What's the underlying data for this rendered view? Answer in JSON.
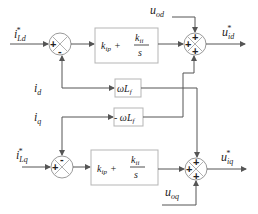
{
  "diagram": {
    "inputs": {
      "i_ref_d": {
        "main": "i",
        "sub": "Ld",
        "sup": "*"
      },
      "i_ref_q": {
        "main": "i",
        "sub": "Lq",
        "sup": "*"
      },
      "i_d": {
        "main": "i",
        "sub": "d"
      },
      "i_q": {
        "main": "i",
        "sub": "q"
      },
      "u_od": {
        "main": "u",
        "sub": "od"
      },
      "u_oq": {
        "main": "u",
        "sub": "oq"
      }
    },
    "outputs": {
      "u_id": {
        "main": "u",
        "sub": "id",
        "sup": "*"
      },
      "u_iq": {
        "main": "u",
        "sub": "iq",
        "sup": "*"
      }
    },
    "blocks": {
      "pi_d": {
        "kp": "k",
        "kp_sub": "ip",
        "plus": "+",
        "ki": "k",
        "ki_sub": "ii",
        "den": "s"
      },
      "pi_q": {
        "kp": "k",
        "kp_sub": "ip",
        "plus": "+",
        "ki": "k",
        "ki_sub": "ii",
        "den": "s"
      },
      "wl_pos": {
        "prefix": "",
        "w": "ωL",
        "sub": "f"
      },
      "wl_neg": {
        "prefix": "- ",
        "w": "ωL",
        "sub": "f"
      }
    },
    "summers": {
      "s1": {
        "left": "+",
        "bottom": "-"
      },
      "s2": {
        "top": "+",
        "left": "+",
        "bottom": "+"
      },
      "s3": {
        "left": "+",
        "top": "-"
      },
      "s4": {
        "top": "+",
        "left": "+",
        "bottom": "+"
      }
    }
  }
}
